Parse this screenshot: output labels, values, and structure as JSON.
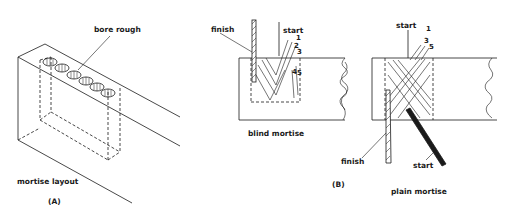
{
  "figure": {
    "panel_a": {
      "tag": "(A)",
      "caption": "mortise layout",
      "callout": "bore rough"
    },
    "panel_b": {
      "tag": "(B)",
      "blind": {
        "caption": "blind mortise",
        "finish_label": "finish",
        "start_label": "start",
        "sequence": [
          "1",
          "2",
          "3",
          "4",
          "5"
        ]
      },
      "plain": {
        "caption": "plain mortise",
        "top_start_label": "start",
        "finish_label": "finish",
        "bottom_start_label": "start",
        "sequence": [
          "1",
          "3",
          "5"
        ]
      }
    }
  },
  "colors": {
    "ink": "#1a1a1a",
    "paper": "#ffffff"
  }
}
